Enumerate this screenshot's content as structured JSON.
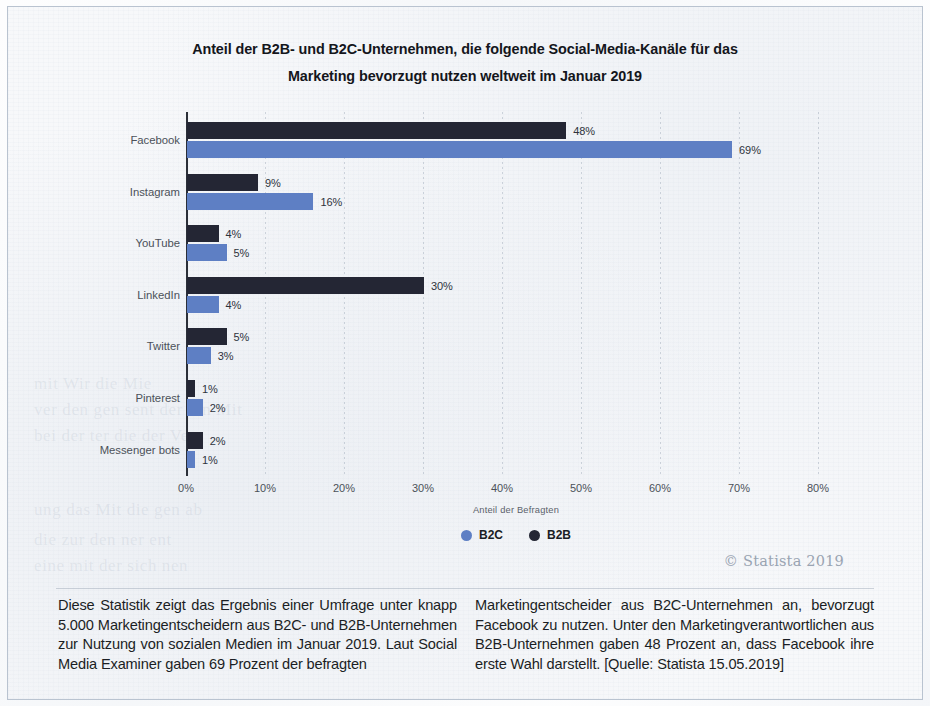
{
  "chart_title_line1": "Anteil der B2B- und B2C-Unternehmen, die folgende Social-Media-Kanäle für das",
  "chart_title_line2": "Marketing bevorzugt nutzen weltweit im Januar 2019",
  "copyright": "© Statista 2019",
  "xaxis_title": "Anteil der Befragten",
  "legend": {
    "b2c_label": "B2C",
    "b2b_label": "B2B",
    "b2c_color": "#5e7fc4",
    "b2b_color": "#242634"
  },
  "body_text": {
    "left": "Diese Statistik zeigt das Ergebnis einer Umfrage unter knapp 5.000 Marketingentscheidern aus B2C- und B2B-Unternehmen zur Nutzung von sozialen Medien im Januar 2019. Laut Social Media Examiner gaben 69 Prozent der befragten",
    "right": "Marketingentscheider aus B2C-Unternehmen an, bevorzugt Facebook zu nutzen. Unter den Marketingverantwortlichen aus B2B-Unternehmen gaben 48 Prozent an, dass Facebook ihre erste Wahl darstellt. [Quelle: Statista 15.05.2019]"
  },
  "chart_data": {
    "type": "bar",
    "orientation": "horizontal",
    "title": "Anteil der B2B- und B2C-Unternehmen, die folgende Social-Media-Kanäle für das Marketing bevorzugt nutzen weltweit im Januar 2019",
    "xlabel": "Anteil der Befragten",
    "ylabel": "",
    "categories": [
      "Facebook",
      "Instagram",
      "YouTube",
      "LinkedIn",
      "Twitter",
      "Pinterest",
      "Messenger bots"
    ],
    "series": [
      {
        "name": "B2B",
        "color": "#242634",
        "values": [
          48,
          9,
          4,
          30,
          5,
          1,
          2
        ],
        "labels": [
          "48%",
          "9%",
          "4%",
          "30%",
          "5%",
          "1%",
          "2%"
        ]
      },
      {
        "name": "B2C",
        "color": "#5e7fc4",
        "values": [
          69,
          16,
          5,
          4,
          3,
          2,
          1
        ],
        "labels": [
          "69%",
          "16%",
          "5%",
          "4%",
          "3%",
          "2%",
          "1%"
        ]
      }
    ],
    "xlim": [
      0,
      80
    ],
    "xticks": [
      0,
      10,
      20,
      30,
      40,
      50,
      60,
      70,
      80
    ],
    "xtick_labels": [
      "0%",
      "10%",
      "20%",
      "30%",
      "40%",
      "50%",
      "60%",
      "70%",
      "80%"
    ],
    "grid": true,
    "grid_axis": "x",
    "legend_position": "bottom",
    "unit": "%"
  },
  "ghosts": [
    {
      "text": "mit   Wir   die   Mie",
      "x": 34,
      "y": 380
    },
    {
      "text": "ver  den  gen  sent  der  ern  Mit",
      "x": 34,
      "y": 406
    },
    {
      "text": "bei   der   ter  die   der   Ver",
      "x": 34,
      "y": 432
    },
    {
      "text": "ung   das   Mit  die   gen   ab",
      "x": 34,
      "y": 506
    },
    {
      "text": "die   zur   den   ner   ent",
      "x": 34,
      "y": 536
    },
    {
      "text": "eine   mit   der   sich   nen",
      "x": 34,
      "y": 562
    }
  ]
}
